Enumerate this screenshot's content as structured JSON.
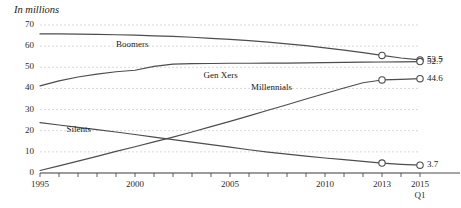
{
  "chart_data": {
    "type": "line",
    "title": "In millions",
    "xlabel": "",
    "ylabel": "",
    "xlim": [
      1995,
      2015
    ],
    "ylim": [
      0,
      70
    ],
    "grid": true,
    "legend_position": "inline-labels",
    "y_ticks": [
      "0",
      "10",
      "20",
      "30",
      "40",
      "50",
      "60",
      "70"
    ],
    "y_tick_values": [
      0,
      10,
      20,
      30,
      40,
      50,
      60,
      70
    ],
    "x_ticks": [
      "1995",
      "2000",
      "2005",
      "2010",
      "2013",
      "2015"
    ],
    "x_tick_values": [
      1995,
      2000,
      2005,
      2010,
      2013,
      2015
    ],
    "x_tick_sublabel": "Q1",
    "x_minor_step": 1,
    "series": [
      {
        "name": "Boomers",
        "label_x": 1999.0,
        "label_y": 60.6,
        "x": [
          1995,
          1996,
          1997,
          1998,
          1999,
          2000,
          2001,
          2002,
          2003,
          2004,
          2005,
          2006,
          2007,
          2008,
          2009,
          2010,
          2011,
          2012,
          2013,
          2014,
          2015
        ],
        "values": [
          65.8,
          65.8,
          65.7,
          65.6,
          65.4,
          65.2,
          64.9,
          64.6,
          64.2,
          63.7,
          63.2,
          62.6,
          61.9,
          61.1,
          60.2,
          59.2,
          58.1,
          56.9,
          55.6,
          54.4,
          53.5
        ],
        "end_label": "53.5",
        "markers": [
          {
            "x": 2013,
            "y": 55.6
          },
          {
            "x": 2015,
            "y": 53.5
          }
        ]
      },
      {
        "name": "Gen Xers",
        "label_x": 2003.6,
        "label_y": 46.0,
        "x": [
          1995,
          1996,
          1997,
          1998,
          1999,
          2000,
          2001,
          2002,
          2003,
          2004,
          2005,
          2006,
          2007,
          2008,
          2009,
          2010,
          2011,
          2012,
          2013,
          2014,
          2015
        ],
        "values": [
          41.2,
          43.6,
          45.4,
          46.8,
          47.9,
          48.6,
          50.4,
          51.5,
          51.7,
          51.8,
          51.9,
          51.9,
          52.0,
          52.0,
          52.1,
          52.2,
          52.3,
          52.4,
          52.5,
          52.6,
          52.7
        ],
        "end_label": "52.7",
        "markers": [
          {
            "x": 2015,
            "y": 52.7
          }
        ]
      },
      {
        "name": "Millennials",
        "label_x": 2006.1,
        "label_y": 40.0,
        "x": [
          1995,
          1996,
          1997,
          1998,
          1999,
          2000,
          2001,
          2002,
          2003,
          2004,
          2005,
          2006,
          2007,
          2008,
          2009,
          2010,
          2011,
          2012,
          2013,
          2014,
          2015
        ],
        "values": [
          1.2,
          3.4,
          5.6,
          7.9,
          10.2,
          12.4,
          14.7,
          17.0,
          19.4,
          21.9,
          24.4,
          27.0,
          29.7,
          32.3,
          35.0,
          37.6,
          40.2,
          42.7,
          44.0,
          44.3,
          44.6
        ],
        "end_label": "44.6",
        "markers": [
          {
            "x": 2013,
            "y": 44.0
          },
          {
            "x": 2015,
            "y": 44.6
          }
        ]
      },
      {
        "name": "Silents",
        "label_x": 1996.4,
        "label_y": 20.3,
        "x": [
          1995,
          1996,
          1997,
          1998,
          1999,
          2000,
          2001,
          2002,
          2003,
          2004,
          2005,
          2006,
          2007,
          2008,
          2009,
          2010,
          2011,
          2012,
          2013,
          2014,
          2015
        ],
        "values": [
          23.8,
          22.7,
          21.6,
          20.5,
          19.4,
          18.2,
          17.0,
          15.8,
          14.6,
          13.4,
          12.2,
          11.0,
          9.9,
          8.9,
          8.0,
          7.1,
          6.3,
          5.5,
          4.7,
          4.1,
          3.7
        ],
        "end_label": "3.7",
        "markers": [
          {
            "x": 2013,
            "y": 4.7
          },
          {
            "x": 2015,
            "y": 3.7
          }
        ]
      }
    ],
    "colors": {
      "line": "#4d4d4d",
      "grid": "#d9d9d9",
      "axis": "#4d4d4d",
      "text": "#1a1a1a",
      "marker_fill": "#ffffff"
    }
  }
}
